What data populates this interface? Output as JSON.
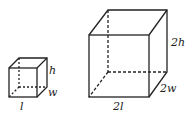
{
  "small_box": {
    "length": "l",
    "width": "w",
    "height": "h"
  },
  "large_box": {
    "length": "2l",
    "width": "2w",
    "height": "2h"
  }
}
